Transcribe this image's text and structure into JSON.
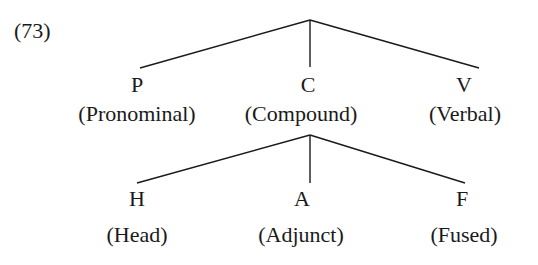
{
  "example_number": "(73)",
  "tree": {
    "root": {
      "children": [
        {
          "symbol": "P",
          "gloss": "(Pronominal)"
        },
        {
          "symbol": "C",
          "gloss": "(Compound)"
        },
        {
          "symbol": "V",
          "gloss": "(Verbal)"
        }
      ]
    },
    "compound": {
      "children": [
        {
          "symbol": "H",
          "gloss": "(Head)"
        },
        {
          "symbol": "A",
          "gloss": "(Adjunct)"
        },
        {
          "symbol": "F",
          "gloss": "(Fused)"
        }
      ]
    }
  },
  "colors": {
    "line": "#1a1a1a",
    "text": "#1a1a1a",
    "background": "#ffffff"
  }
}
